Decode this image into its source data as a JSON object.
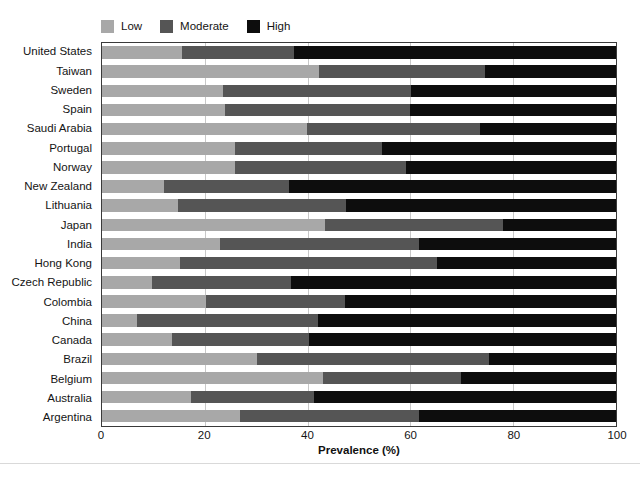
{
  "chart_data": {
    "type": "bar",
    "orientation": "horizontal",
    "stacked": true,
    "stacked_mode": "percent",
    "title": "",
    "subtitle": "",
    "xlabel": "Prevalence (%)",
    "ylabel": "",
    "xlim": [
      0,
      100
    ],
    "xticks": [
      0,
      20,
      40,
      60,
      80,
      100
    ],
    "xtick_labels": [
      "0",
      "20",
      "40",
      "60",
      "80",
      "100"
    ],
    "grid": "vertical",
    "legend_position": "top-left",
    "legend": [
      "Low",
      "Moderate",
      "High"
    ],
    "colors": {
      "Low": "#a8a8a8",
      "Moderate": "#555555",
      "High": "#0d0d0d"
    },
    "categories": [
      "United States",
      "Taiwan",
      "Sweden",
      "Spain",
      "Saudi Arabia",
      "Portugal",
      "Norway",
      "New Zealand",
      "Lithuania",
      "Japan",
      "India",
      "Hong Kong",
      "Czech Republic",
      "Colombia",
      "China",
      "Canada",
      "Brazil",
      "Belgium",
      "Australia",
      "Argentina"
    ],
    "series": [
      {
        "name": "Low",
        "values": [
          15.5,
          42.3,
          23.6,
          23.9,
          39.9,
          25.8,
          25.8,
          12.0,
          14.7,
          43.3,
          22.9,
          15.2,
          9.8,
          20.2,
          6.8,
          13.6,
          30.2,
          43.0,
          17.4,
          26.9
        ]
      },
      {
        "name": "Moderate",
        "values": [
          21.8,
          32.3,
          36.6,
          36.1,
          33.6,
          28.7,
          33.4,
          24.4,
          32.8,
          34.7,
          38.8,
          50.0,
          26.9,
          27.0,
          35.2,
          26.6,
          45.1,
          26.9,
          23.8,
          34.8
        ]
      },
      {
        "name": "High",
        "values": [
          62.7,
          25.4,
          39.8,
          40.0,
          26.5,
          45.5,
          40.8,
          63.6,
          52.5,
          22.0,
          38.3,
          34.8,
          63.3,
          52.8,
          58.0,
          59.8,
          24.7,
          30.1,
          58.8,
          38.3
        ]
      }
    ]
  }
}
